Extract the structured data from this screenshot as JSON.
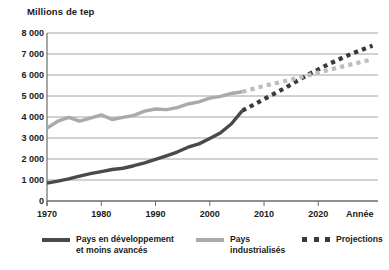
{
  "chart_data": {
    "type": "line",
    "title": "",
    "ylabel": "Millions de tep",
    "xlabel": "Année",
    "xlim": [
      1970,
      2031
    ],
    "ylim": [
      0,
      8000
    ],
    "ytick_labels": [
      "8 000",
      "7 000",
      "6 000",
      "5 000",
      "4 000",
      "3 000",
      "2 000",
      "1 000",
      "0"
    ],
    "ytick_values": [
      8000,
      7000,
      6000,
      5000,
      4000,
      3000,
      2000,
      1000,
      0
    ],
    "xtick_labels": [
      "1970",
      "1980",
      "1990",
      "2000",
      "2010",
      "2020"
    ],
    "xtick_values": [
      1970,
      1980,
      1990,
      2000,
      2010,
      2020
    ],
    "grid": true,
    "legend_position": "below",
    "colors": {
      "developing": "#4a4a4a",
      "industrialized": "#aaaaaa",
      "projection_marker": "#3a3a3a",
      "grid": "#9a9a9a",
      "axis": "#6b6b6b",
      "text": "#1a1a1a"
    },
    "series": [
      {
        "name": "Pays en développement et moins avancés",
        "style": "solid",
        "color": "#4a4a4a",
        "x": [
          1970,
          1972,
          1974,
          1976,
          1978,
          1980,
          1982,
          1984,
          1986,
          1988,
          1990,
          1992,
          1994,
          1996,
          1998,
          2000,
          2002,
          2004,
          2006
        ],
        "values": [
          850,
          950,
          1050,
          1180,
          1300,
          1400,
          1500,
          1560,
          1680,
          1820,
          1980,
          2150,
          2330,
          2560,
          2720,
          2980,
          3250,
          3680,
          4300
        ]
      },
      {
        "name": "Pays en développement et moins avancés (projection)",
        "style": "dashed",
        "color": "#3a3a3a",
        "x": [
          2006,
          2010,
          2014,
          2018,
          2022,
          2026,
          2030
        ],
        "values": [
          4300,
          4850,
          5400,
          6000,
          6530,
          7000,
          7400
        ]
      },
      {
        "name": "Pays industrialisés",
        "style": "solid",
        "color": "#aaaaaa",
        "x": [
          1970,
          1972,
          1974,
          1976,
          1978,
          1980,
          1982,
          1984,
          1986,
          1988,
          1990,
          1992,
          1994,
          1996,
          1998,
          2000,
          2002,
          2004,
          2006
        ],
        "values": [
          3470,
          3800,
          3980,
          3800,
          3950,
          4100,
          3880,
          3980,
          4080,
          4280,
          4380,
          4350,
          4450,
          4620,
          4720,
          4900,
          4980,
          5120,
          5200
        ]
      },
      {
        "name": "Pays industrialisés (projection)",
        "style": "dashed",
        "color": "#bdbdbd",
        "x": [
          2006,
          2010,
          2014,
          2018,
          2022,
          2026,
          2030
        ],
        "values": [
          5200,
          5480,
          5720,
          5980,
          6250,
          6500,
          6750
        ]
      }
    ]
  },
  "legend": {
    "items": [
      {
        "label": "Pays en développement\net moins avancés",
        "swatch": "solid-dark"
      },
      {
        "label": "Pays\nindustrialisés",
        "swatch": "solid-light"
      },
      {
        "label": "Projections",
        "swatch": "dashed-dark"
      }
    ]
  }
}
